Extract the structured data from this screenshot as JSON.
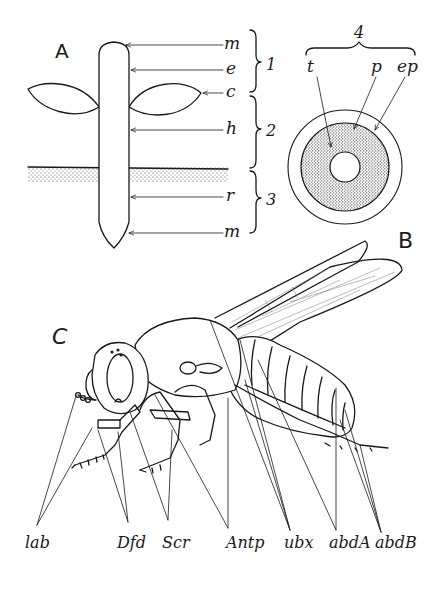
{
  "panels": {
    "A": {
      "letter": "A",
      "labels": {
        "m_top": "m",
        "e": "e",
        "c": "c",
        "h": "h",
        "r": "r",
        "m_bottom": "m"
      },
      "brackets": {
        "b1": "1",
        "b2": "2",
        "b3": "3"
      }
    },
    "B": {
      "letter": "B",
      "bracket": "4",
      "labels": {
        "t": "t",
        "p": "p",
        "ep": "ep"
      }
    },
    "C": {
      "letter": "C",
      "labels": [
        "lab",
        "Dfd",
        "Scr",
        "Antp",
        "ubx",
        "abdA",
        "abdB"
      ]
    }
  },
  "colors": {
    "ink": "#1a1a1a",
    "background": "#ffffff",
    "stipple": "#555555"
  }
}
